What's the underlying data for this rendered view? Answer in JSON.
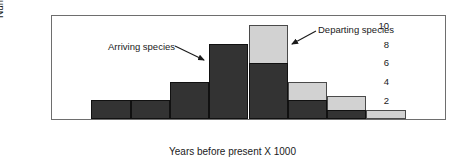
{
  "chart_data": {
    "type": "bar",
    "title": "",
    "xlabel": "Years before present X 1000",
    "ylabel": "Number of species",
    "xlim": [
      0,
      20
    ],
    "ylim": [
      0,
      11
    ],
    "grid": false,
    "legend_position": "annotations-on-plot",
    "bin_width": 2,
    "x_ticks": [
      0,
      2,
      4,
      6,
      8,
      10,
      12,
      14,
      16,
      18,
      20
    ],
    "y_ticks": [
      0,
      2,
      4,
      6,
      8,
      10
    ],
    "x_tick_labels": [
      "0",
      "2",
      "4",
      "6",
      "8",
      "10",
      "12",
      "14",
      "16",
      "18",
      "20"
    ],
    "y_tick_labels": [
      "0",
      "2",
      "4",
      "6",
      "8",
      "10"
    ],
    "bins": [
      [
        0,
        2
      ],
      [
        2,
        4
      ],
      [
        4,
        6
      ],
      [
        6,
        8
      ],
      [
        8,
        10
      ],
      [
        10,
        12
      ],
      [
        12,
        14
      ],
      [
        14,
        16
      ],
      [
        16,
        18
      ],
      [
        18,
        20
      ]
    ],
    "series": [
      {
        "name": "Arriving species",
        "color": "#333333",
        "values": [
          0,
          2,
          2,
          4,
          8,
          6,
          2,
          1,
          0,
          0
        ]
      },
      {
        "name": "Departing species",
        "color": "#d2d2d2",
        "values": [
          0,
          1,
          1,
          1,
          5,
          10,
          4,
          2.5,
          1,
          0
        ]
      }
    ],
    "annotations": [
      {
        "text": "Arriving species",
        "target_x": 8,
        "target_y": 7.7
      },
      {
        "text": "Departing species",
        "target_x": 12,
        "target_y": 8.6
      }
    ]
  },
  "figure": {
    "y_axis_title": "Number of species",
    "x_axis_title": "Years before present X 1000",
    "arriving_label": "Arriving species",
    "departing_label": "Departing species"
  }
}
